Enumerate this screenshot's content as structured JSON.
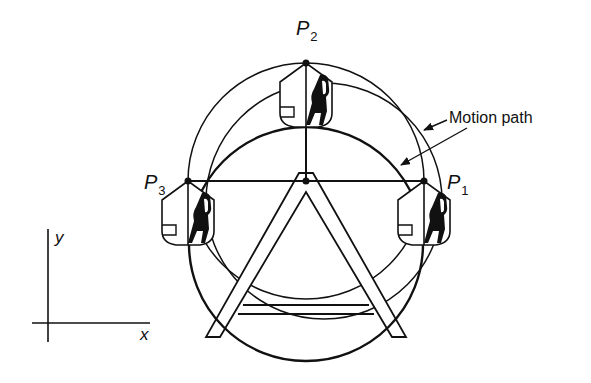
{
  "figure": {
    "type": "mechanism-diagram",
    "colors": {
      "ink": "#111111",
      "background": "#ffffff"
    }
  },
  "labels": {
    "p1": {
      "main": "P",
      "sub": "1"
    },
    "p2": {
      "main": "P",
      "sub": "2"
    },
    "p3": {
      "main": "P",
      "sub": "3"
    },
    "callout": "Motion path",
    "axis_x": "x",
    "axis_y": "y"
  },
  "geometry": {
    "hub": [
      306,
      181
    ],
    "pivot_points": {
      "P1": [
        424,
        181
      ],
      "P2": [
        306,
        63
      ],
      "P3": [
        188,
        181
      ]
    },
    "pivot_circle": {
      "cx": 306,
      "cy": 181,
      "r": 118
    },
    "seat_circle": {
      "cx": 324,
      "cy": 201,
      "r": 118
    },
    "wheel_circle": {
      "cx": 306,
      "cy": 244,
      "r": 117
    }
  }
}
